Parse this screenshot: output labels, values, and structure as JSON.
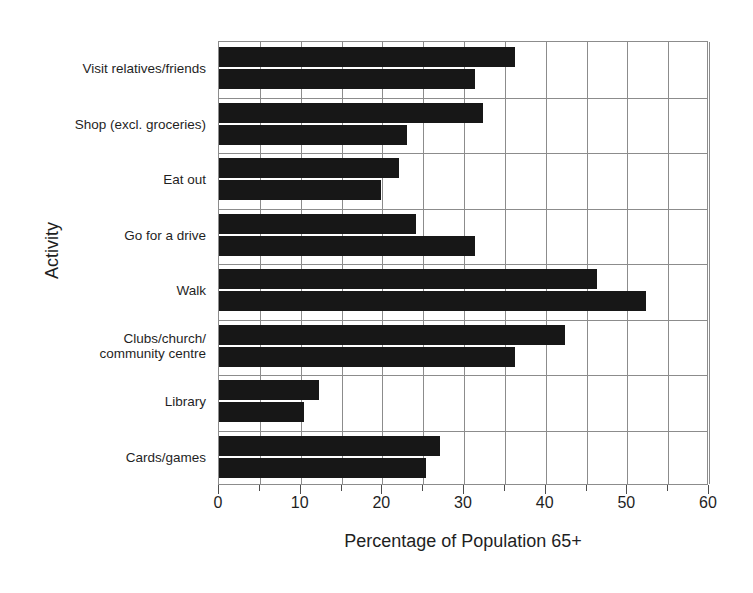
{
  "chart_data": {
    "type": "bar",
    "orientation": "horizontal",
    "title": "",
    "xlabel": "Percentage of Population 65+",
    "ylabel": "Activity",
    "xlim": [
      0,
      60
    ],
    "xticks": [
      0,
      10,
      20,
      30,
      40,
      50,
      60
    ],
    "xtick_labels": [
      "0",
      "10",
      "20",
      "30",
      "40",
      "50",
      "60"
    ],
    "minor_tick_step": 5,
    "grid": true,
    "legend": "none",
    "categories": [
      "Visit relatives/friends",
      "Shop (excl. groceries)",
      "Eat out",
      "Go for a drive",
      "Walk",
      "Clubs/church/\ncommunity centre",
      "Library",
      "Cards/games"
    ],
    "series": [
      {
        "name": "series-1",
        "values": [
          36.3,
          32.3,
          22.0,
          24.1,
          46.3,
          42.4,
          12.3,
          27.1
        ]
      },
      {
        "name": "series-2",
        "values": [
          31.3,
          23.0,
          19.8,
          31.3,
          52.3,
          36.3,
          10.4,
          25.4
        ]
      }
    ],
    "colors": {
      "bar": "#171717",
      "grid": "#8c8c8c",
      "axis": "#4d4d4d",
      "text": "#1f1f1f",
      "background": "#ffffff"
    }
  }
}
